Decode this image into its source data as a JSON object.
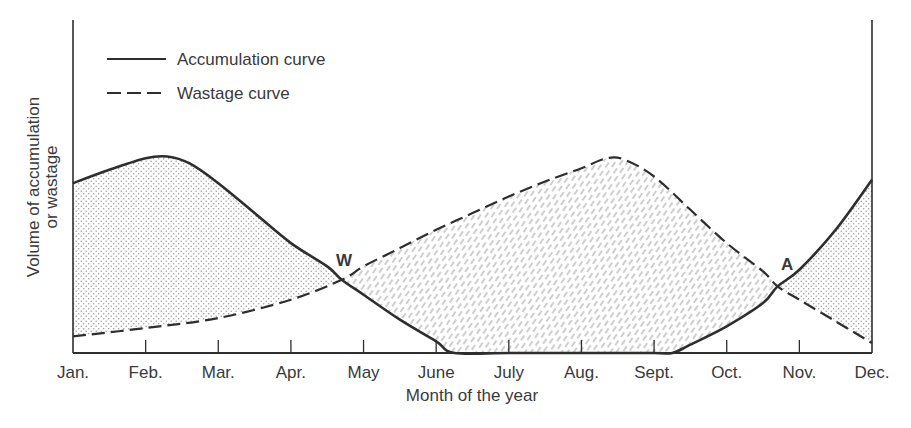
{
  "chart_data": {
    "type": "line",
    "title": "",
    "xlabel": "Month of the year",
    "ylabel": "Volume of accumulation or wastage",
    "ylabel_lines": [
      "Volume of accumulation",
      "or wastage"
    ],
    "categories": [
      "Jan.",
      "Feb.",
      "Mar.",
      "Apr.",
      "May",
      "June",
      "July",
      "Aug.",
      "Sept.",
      "Oct.",
      "Nov.",
      "Dec."
    ],
    "ylim": [
      0,
      100
    ],
    "yticks": "none",
    "grid": false,
    "legend_position": "top-left",
    "series": [
      {
        "name": "Accumulation curve",
        "style": "solid",
        "points": [
          [
            0,
            51
          ],
          [
            0.5,
            55
          ],
          [
            1.0,
            58.5
          ],
          [
            1.3,
            59
          ],
          [
            1.6,
            57
          ],
          [
            2.0,
            51
          ],
          [
            2.5,
            42
          ],
          [
            3.0,
            33
          ],
          [
            3.5,
            26
          ],
          [
            3.7,
            22
          ],
          [
            4.0,
            17.5
          ],
          [
            4.5,
            10
          ],
          [
            5.0,
            3.5
          ],
          [
            5.25,
            0
          ],
          [
            6.0,
            0
          ],
          [
            7.0,
            0
          ],
          [
            8.0,
            0
          ],
          [
            8.25,
            0
          ],
          [
            8.5,
            2.5
          ],
          [
            9.0,
            8
          ],
          [
            9.5,
            15
          ],
          [
            9.7,
            20
          ],
          [
            10.0,
            25
          ],
          [
            10.5,
            37
          ],
          [
            11.0,
            52
          ]
        ]
      },
      {
        "name": "Wastage curve",
        "style": "dashed",
        "points": [
          [
            0,
            5
          ],
          [
            1.0,
            7.5
          ],
          [
            2.0,
            10.5
          ],
          [
            3.0,
            16
          ],
          [
            3.7,
            22
          ],
          [
            4.0,
            26
          ],
          [
            4.5,
            31.5
          ],
          [
            5.0,
            37
          ],
          [
            5.5,
            42
          ],
          [
            6.0,
            47
          ],
          [
            6.5,
            51.5
          ],
          [
            7.0,
            55.5
          ],
          [
            7.35,
            58.5
          ],
          [
            7.6,
            58
          ],
          [
            8.0,
            53
          ],
          [
            8.5,
            43
          ],
          [
            9.0,
            33
          ],
          [
            9.5,
            24.5
          ],
          [
            9.7,
            20
          ],
          [
            10.0,
            16
          ],
          [
            10.5,
            9.5
          ],
          [
            11.0,
            3
          ]
        ]
      }
    ],
    "annotations": [
      {
        "label": "W",
        "x": 3.7,
        "y": 22,
        "note": "Intersection where wastage begins to exceed accumulation"
      },
      {
        "label": "A",
        "x": 9.7,
        "y": 20,
        "note": "Intersection where accumulation begins to exceed wastage"
      }
    ],
    "shaded_regions": [
      {
        "pattern": "dotted",
        "between": "accumulation above wastage",
        "range": [
          0,
          3.7
        ]
      },
      {
        "pattern": "hatched-dashes",
        "between": "wastage above accumulation",
        "range": [
          3.7,
          9.7
        ]
      },
      {
        "pattern": "dotted",
        "between": "accumulation above wastage",
        "range": [
          9.7,
          11
        ]
      }
    ]
  },
  "legend": {
    "items": [
      {
        "label": "Accumulation curve",
        "style": "solid"
      },
      {
        "label": "Wastage curve",
        "style": "dashed"
      }
    ]
  },
  "labels": {
    "point_w": "W",
    "point_a": "A"
  },
  "colors": {
    "line": "#2e2e2e",
    "text": "#3a3a3a",
    "dot_fill": "#9a9a9a",
    "hatch": "#a8a8a8"
  }
}
